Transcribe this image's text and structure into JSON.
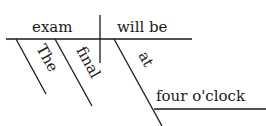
{
  "diagram": {
    "type": "sentence-diagram",
    "subject": "exam",
    "verb": "will be",
    "modifiers": [
      {
        "word": "The",
        "modifies": "exam"
      },
      {
        "word": "final",
        "modifies": "exam"
      }
    ],
    "prepositional_phrase": {
      "preposition": "at",
      "object": "four o'clock",
      "modifies": "will be"
    },
    "colors": {
      "ink": "#1a1a1a",
      "background": "#ffffff"
    }
  }
}
